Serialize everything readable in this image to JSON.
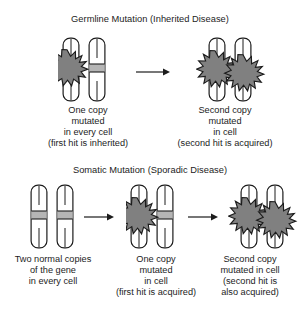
{
  "figure": {
    "type": "diagram",
    "background_color": "#ffffff",
    "ink_color": "#1c1c1c",
    "starburst_fill": "#808080",
    "starburst_stroke": "#1c1c1c",
    "chromosome_fill": "#ffffff",
    "chromosome_stroke": "#1c1c1c",
    "band_fill": "#b5b5b5"
  },
  "panels": [
    {
      "id": "germline",
      "title": "Germline Mutation (Inherited Disease)",
      "steps": [
        {
          "id": "germline-step-1",
          "chromosomes": [
            {
              "name": "chromosome-left",
              "band": false,
              "starburst": true
            },
            {
              "name": "chromosome-right",
              "band": true,
              "starburst": false
            }
          ],
          "caption": [
            "One copy",
            "mutated",
            "in every cell",
            "(first hit is inherited)"
          ]
        },
        {
          "id": "germline-step-2",
          "chromosomes": [
            {
              "name": "chromosome-left",
              "band": false,
              "starburst": true
            },
            {
              "name": "chromosome-right",
              "band": false,
              "starburst": true
            }
          ],
          "caption": [
            "Second copy",
            "mutated",
            "in cell",
            "(second hit is acquired)"
          ]
        }
      ],
      "arrows": 1
    },
    {
      "id": "somatic",
      "title": "Somatic Mutation (Sporadic Disease)",
      "steps": [
        {
          "id": "somatic-step-1",
          "chromosomes": [
            {
              "name": "chromosome-left",
              "band": true,
              "starburst": false
            },
            {
              "name": "chromosome-right",
              "band": true,
              "starburst": false
            }
          ],
          "caption": [
            "Two normal copies",
            "of the gene",
            "in every cell"
          ]
        },
        {
          "id": "somatic-step-2",
          "chromosomes": [
            {
              "name": "chromosome-left",
              "band": false,
              "starburst": true
            },
            {
              "name": "chromosome-right",
              "band": true,
              "starburst": false
            }
          ],
          "caption": [
            "One copy",
            "mutated",
            "in cell",
            "(first hit is acquired)"
          ]
        },
        {
          "id": "somatic-step-3",
          "chromosomes": [
            {
              "name": "chromosome-left",
              "band": false,
              "starburst": true
            },
            {
              "name": "chromosome-right",
              "band": false,
              "starburst": true
            }
          ],
          "caption": [
            "Second copy",
            "mutated in cell",
            "(second hit is",
            "also acquired)"
          ]
        }
      ],
      "arrows": 2
    }
  ]
}
